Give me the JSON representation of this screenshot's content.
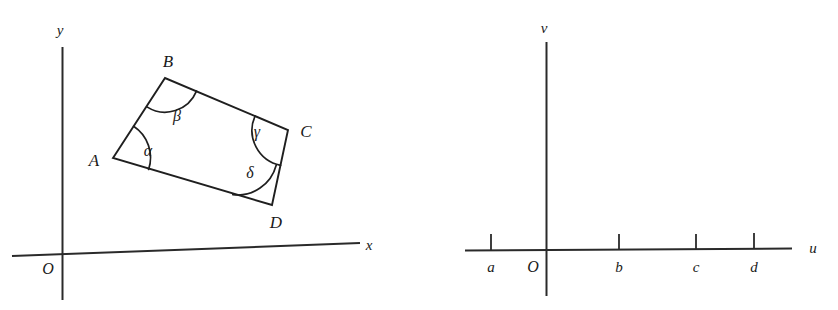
{
  "figure": {
    "background_color": "#ffffff",
    "ink_color": "#1f1f1f"
  },
  "left_diagram": {
    "name": "quadrilateral-in-xy-plane",
    "axes": {
      "x_label": "x",
      "y_label": "y",
      "origin_label": "O"
    },
    "vertices": [
      {
        "label": "A",
        "x": 113,
        "y": 158
      },
      {
        "label": "B",
        "x": 165,
        "y": 78
      },
      {
        "label": "C",
        "x": 288,
        "y": 130
      },
      {
        "label": "D",
        "x": 272,
        "y": 205
      }
    ],
    "angles": [
      {
        "label": "α",
        "at": "A"
      },
      {
        "label": "β",
        "at": "B"
      },
      {
        "label": "γ",
        "at": "C"
      },
      {
        "label": "δ",
        "at": "D"
      }
    ]
  },
  "right_diagram": {
    "name": "uv-number-line",
    "axes": {
      "u_label": "u",
      "v_label": "v",
      "origin_label": "O"
    },
    "ticks": [
      {
        "label": "a",
        "x": 491
      },
      {
        "label": "b",
        "x": 619
      },
      {
        "label": "c",
        "x": 696
      },
      {
        "label": "d",
        "x": 754
      }
    ]
  }
}
